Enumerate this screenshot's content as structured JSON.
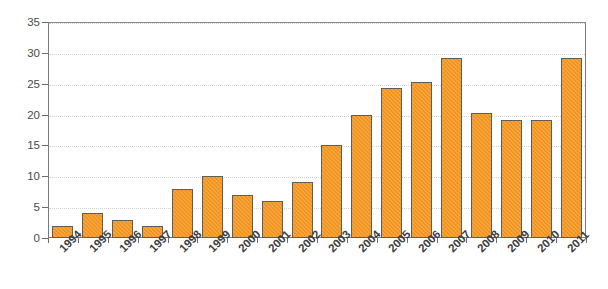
{
  "chart_data": {
    "type": "bar",
    "title": "",
    "xlabel": "",
    "ylabel": "Number of breeding pairs",
    "ylim": [
      0,
      35
    ],
    "ytick_labels": [
      "0",
      "5",
      "10",
      "15",
      "20",
      "25",
      "30",
      "35"
    ],
    "ytick_values": [
      0,
      5,
      10,
      15,
      20,
      25,
      30,
      35
    ],
    "grid": true,
    "legend": "none",
    "bar_color": "#f5961e",
    "bar_edge_color": "#5d5d5d",
    "categories": [
      "1994",
      "1995",
      "1996",
      "1997",
      "1998",
      "1999",
      "2000",
      "2001",
      "2002",
      "2003",
      "2004",
      "2005",
      "2006",
      "2007",
      "2008",
      "2009",
      "2010",
      "2011"
    ],
    "values": [
      2,
      4,
      3,
      2,
      8,
      10,
      7,
      6,
      9,
      15,
      20,
      24.3,
      25.3,
      29.2,
      20.2,
      19.2,
      19.2,
      29.2
    ]
  }
}
